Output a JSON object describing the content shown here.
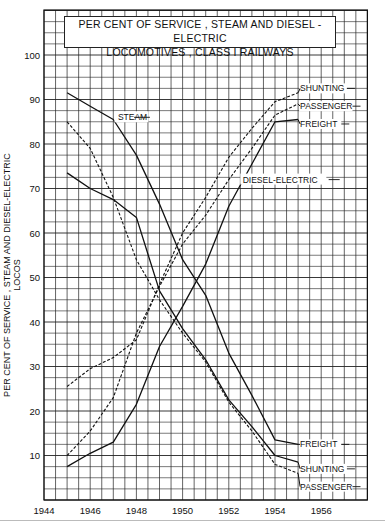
{
  "chart_data": {
    "type": "line",
    "title": "PER CENT OF SERVICE , STEAM AND DIESEL - ELECTRIC LOCOMOTIVES , CLASS I RAILWAYS",
    "title_lines": [
      "PER CENT OF SERVICE , STEAM AND DIESEL - ELECTRIC",
      "LOCOMOTIVES , CLASS I RAILWAYS"
    ],
    "xlabel": "",
    "ylabel": "PER CENT OF SERVICE , STEAM AND DIESEL-ELECTRIC LOCOS",
    "xlim": [
      1944,
      1958
    ],
    "ylim": [
      0,
      110
    ],
    "grid": true,
    "x_ticks": [
      1944,
      1946,
      1948,
      1950,
      1952,
      1954,
      1956
    ],
    "y_ticks": [
      10,
      20,
      30,
      40,
      50,
      60,
      70,
      80,
      90,
      100
    ],
    "x": [
      1945,
      1946,
      1947,
      1948,
      1949,
      1950,
      1951,
      1952,
      1953,
      1954,
      1955
    ],
    "group_labels": {
      "steam": "STEAM",
      "diesel": "DIESEL-ELECTRIC"
    },
    "series": [
      {
        "name": "Steam Freight",
        "group": "steam",
        "style": "solid",
        "label": "FREIGHT",
        "values": [
          91.5,
          88.5,
          85.5,
          77.5,
          66.5,
          54,
          46,
          33,
          23.5,
          13.5,
          12.5
        ]
      },
      {
        "name": "Steam Passenger",
        "group": "steam",
        "style": "dashed",
        "label": "PASSENGER",
        "values": [
          85,
          79,
          68,
          54,
          45,
          37.5,
          31,
          22,
          15.5,
          8,
          6
        ]
      },
      {
        "name": "Steam Shunting",
        "group": "steam",
        "style": "solid",
        "label": "SHUNTING",
        "values": [
          73.5,
          70,
          67.5,
          63.5,
          47,
          38.5,
          31.5,
          22.5,
          16.5,
          10,
          8.5
        ]
      },
      {
        "name": "Diesel-Electric Freight",
        "group": "diesel",
        "style": "solid",
        "label": "FREIGHT",
        "values": [
          7.5,
          10.5,
          13,
          21.5,
          34.5,
          43.5,
          53,
          66,
          75.5,
          85,
          85.5
        ]
      },
      {
        "name": "Diesel-Electric Passenger",
        "group": "diesel",
        "style": "dashed",
        "label": "PASSENGER",
        "values": [
          10,
          15.5,
          23,
          37.5,
          48,
          57.5,
          64,
          72,
          79,
          86.5,
          89
        ]
      },
      {
        "name": "Diesel-Electric Shunting",
        "group": "diesel",
        "style": "dashed",
        "label": "SHUNTING",
        "values": [
          25.5,
          29.5,
          32,
          36,
          48.5,
          60,
          68,
          77,
          83.5,
          89.5,
          91.5
        ]
      }
    ],
    "legend_position": "inline labels at right end of lines"
  },
  "colors": {
    "ink": "#111111",
    "grid": "#222222",
    "paper": "#ffffff"
  }
}
